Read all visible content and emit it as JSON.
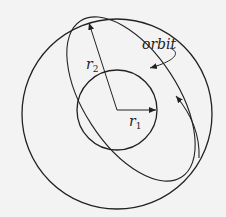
{
  "diagram": {
    "type": "orbit-transfer",
    "labels": {
      "orbit": "orbit",
      "r2": "r",
      "r2_sub": "2",
      "r1": "r",
      "r1_sub": "1"
    },
    "outer_circle": {
      "cx": 117,
      "cy": 113,
      "r": 95
    },
    "inner_circle": {
      "cx": 117,
      "cy": 110,
      "r": 40
    },
    "colors": {
      "stroke": "#222222",
      "background": "#f3f3f3"
    }
  }
}
